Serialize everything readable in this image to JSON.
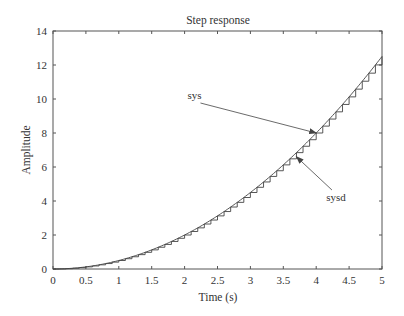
{
  "chart_data": {
    "type": "line",
    "title": "Step response",
    "xlabel": "Time (s)",
    "ylabel": "Amplitude",
    "xlim": [
      0,
      5
    ],
    "ylim": [
      0,
      14
    ],
    "xticks": [
      0,
      0.5,
      1,
      1.5,
      2,
      2.5,
      3,
      3.5,
      4,
      4.5,
      5
    ],
    "xtick_labels": [
      "0",
      "0.5",
      "1",
      "1.5",
      "2",
      "2.5",
      "3",
      "3.5",
      "4",
      "4.5",
      "5"
    ],
    "yticks": [
      0,
      2,
      4,
      6,
      8,
      10,
      12,
      14
    ],
    "ytick_labels": [
      "0",
      "2",
      "4",
      "6",
      "8",
      "10",
      "12",
      "14"
    ],
    "grid": false,
    "legend": null,
    "series": [
      {
        "name": "sys",
        "style": "continuous",
        "description": "Continuous step response, y = t^2/2",
        "x": [
          0,
          0.5,
          1,
          1.5,
          2,
          2.5,
          3,
          3.5,
          4,
          4.5,
          5
        ],
        "values": [
          0,
          0.125,
          0.5,
          1.125,
          2,
          3.125,
          4.5,
          6.125,
          8,
          10.125,
          12.5
        ]
      },
      {
        "name": "sysd",
        "style": "stairs",
        "sample_time": 0.1,
        "description": "Discretized step response (staircase), tracks sys",
        "x": [
          0,
          0.5,
          1,
          1.5,
          2,
          2.5,
          3,
          3.5,
          4,
          4.5,
          5
        ],
        "values": [
          0,
          0.125,
          0.5,
          1.125,
          2,
          3.125,
          4.5,
          6.125,
          8,
          10.125,
          12.5
        ]
      }
    ],
    "annotations": [
      {
        "text": "sys",
        "label_x": 2.15,
        "label_y": 10.0,
        "arrow_to_x": 4.0,
        "arrow_to_y": 8.0
      },
      {
        "text": "sysd",
        "label_x": 4.3,
        "label_y": 4.0,
        "arrow_to_x": 3.7,
        "arrow_to_y": 6.6
      }
    ]
  },
  "colors": {
    "axes": "#555555",
    "curve": "#444444",
    "text": "#333333"
  }
}
